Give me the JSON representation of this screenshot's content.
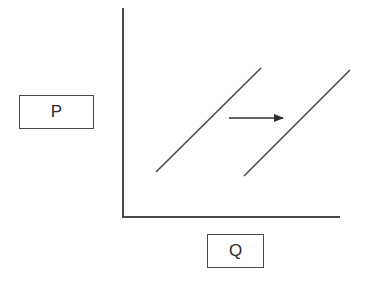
{
  "diagram": {
    "type": "supply-shift",
    "y_axis_label": "P",
    "x_axis_label": "Q",
    "colors": {
      "line": "#4a4a4a",
      "background": "#ffffff",
      "text": "#2a2a2a"
    },
    "curves": [
      {
        "name": "original-curve",
        "x1": 156,
        "y1": 172,
        "x2": 261,
        "y2": 68
      },
      {
        "name": "shifted-curve",
        "x1": 244,
        "y1": 176,
        "x2": 350,
        "y2": 70
      }
    ],
    "shift_arrow": {
      "direction": "right",
      "x1": 229,
      "x2": 283,
      "y": 118
    }
  }
}
